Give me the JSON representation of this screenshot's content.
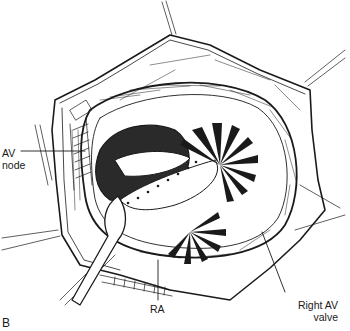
{
  "figure": {
    "panel_letter": "B",
    "labels": {
      "av_node": {
        "line1": "AV",
        "line2": "node"
      },
      "ra": "RA",
      "right_av_valve": {
        "line1": "Right AV",
        "line2": "valve"
      }
    },
    "colors": {
      "ink": "#1a1a1a",
      "background": "#ffffff"
    }
  }
}
